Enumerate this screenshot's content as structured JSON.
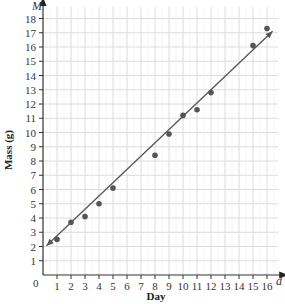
{
  "chart_data": {
    "type": "scatter",
    "title": "",
    "xlabel": "Day",
    "ylabel": "Mass (g)",
    "x_axis_variable": "d",
    "y_axis_variable": "M",
    "origin_label": "0",
    "xlim": [
      0,
      16.8
    ],
    "ylim": [
      0,
      18.8
    ],
    "x_ticks": [
      1,
      2,
      3,
      4,
      5,
      6,
      7,
      8,
      9,
      10,
      11,
      12,
      13,
      14,
      15,
      16
    ],
    "y_ticks": [
      1,
      2,
      3,
      4,
      5,
      6,
      7,
      8,
      9,
      10,
      11,
      12,
      13,
      14,
      15,
      16,
      17,
      18
    ],
    "grid": true,
    "legend": null,
    "series": [
      {
        "name": "Observed mass",
        "type": "scatter",
        "color": "#555555",
        "x": [
          1,
          2,
          3,
          4,
          5,
          8,
          9,
          10,
          11,
          12,
          15,
          16
        ],
        "y": [
          2.5,
          3.7,
          4.1,
          5.0,
          6.1,
          8.4,
          9.9,
          11.2,
          11.6,
          12.8,
          16.1,
          17.3
        ]
      },
      {
        "name": "Line of best fit",
        "type": "line",
        "color": "#555555",
        "x": [
          0.25,
          16.4
        ],
        "y": [
          2.05,
          17.1
        ],
        "arrows": "both"
      }
    ]
  }
}
